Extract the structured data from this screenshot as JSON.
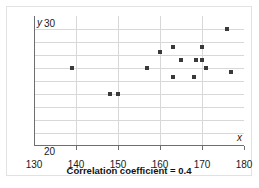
{
  "caption": "Correlation coefficient = 0.4",
  "axis_name_x": "x",
  "axis_name_y": "y",
  "chart_data": {
    "type": "scatter",
    "title": "",
    "subtitle": "",
    "annotation": "Correlation coefficient = 0.4",
    "correlation_coefficient": 0.4,
    "xlabel": "x",
    "ylabel": "y",
    "xlim": [
      130,
      180
    ],
    "ylim": [
      20,
      30
    ],
    "xticks": [
      130,
      140,
      150,
      160,
      170,
      180
    ],
    "yticks": [
      20,
      30
    ],
    "ytick_labels": [
      "20",
      "30"
    ],
    "xtick_labels": [
      "130",
      "140",
      "150",
      "160",
      "170",
      "180"
    ],
    "grid": true,
    "grid_x_step": 10,
    "grid_y_step": 1,
    "legend": false,
    "marker": "square",
    "marker_color": "#3a3a3a",
    "points": [
      {
        "x": 139.0,
        "y": 26.0
      },
      {
        "x": 148.0,
        "y": 24.0
      },
      {
        "x": 150.0,
        "y": 24.0
      },
      {
        "x": 157.0,
        "y": 26.0
      },
      {
        "x": 160.0,
        "y": 27.2
      },
      {
        "x": 163.0,
        "y": 27.6
      },
      {
        "x": 163.0,
        "y": 25.3
      },
      {
        "x": 165.0,
        "y": 26.6
      },
      {
        "x": 168.0,
        "y": 25.3
      },
      {
        "x": 168.5,
        "y": 26.6
      },
      {
        "x": 170.0,
        "y": 26.6
      },
      {
        "x": 170.0,
        "y": 27.6
      },
      {
        "x": 171.0,
        "y": 26.0
      },
      {
        "x": 176.0,
        "y": 29.0
      },
      {
        "x": 177.0,
        "y": 25.7
      }
    ]
  }
}
